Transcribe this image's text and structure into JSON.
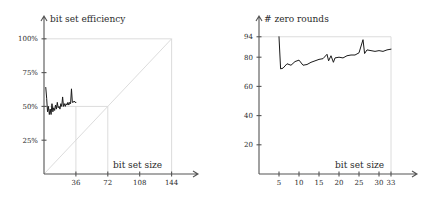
{
  "figure": {
    "background_color": "#ffffff",
    "line_color": "#1a1a1a",
    "guide_color": "#d8d8d8",
    "axis_color": "#555555",
    "panel_count": 2
  },
  "chart_data": [
    {
      "id": "bit-set-efficiency",
      "type": "line",
      "title": "",
      "ylabel": "bit set efficiency",
      "xlabel": "bit set size",
      "xlim": [
        0,
        158
      ],
      "ylim": [
        0,
        108
      ],
      "grid": false,
      "legend": "none",
      "xticks": [
        36,
        72,
        108,
        144
      ],
      "xtick_labels": [
        "36",
        "72",
        "108",
        "144"
      ],
      "yticks": [
        25,
        50,
        75,
        100
      ],
      "ytick_labels": [
        "25%",
        "50%",
        "75%",
        "100%"
      ],
      "guides": [
        {
          "kind": "horizontal",
          "y": 100,
          "x_from": 0,
          "x_to": 144
        },
        {
          "kind": "vertical",
          "x": 144,
          "y_from": 0,
          "y_to": 100
        },
        {
          "kind": "diagonal",
          "from": [
            0,
            0
          ],
          "to": [
            144,
            100
          ]
        },
        {
          "kind": "horizontal",
          "y": 50,
          "x_from": 0,
          "x_to": 72
        },
        {
          "kind": "vertical",
          "x": 72,
          "y_from": 0,
          "y_to": 50
        },
        {
          "kind": "vertical",
          "x": 36,
          "y_from": 0,
          "y_to": 50
        }
      ],
      "x": [
        2,
        3,
        4,
        5,
        6,
        7,
        8,
        9,
        10,
        11,
        12,
        13,
        14,
        15,
        16,
        17,
        18,
        19,
        20,
        21,
        22,
        23,
        24,
        25,
        26,
        27,
        28,
        29,
        30,
        31,
        32,
        33,
        34,
        35,
        36
      ],
      "values": [
        64,
        56,
        46,
        50,
        44,
        48,
        44,
        52,
        46,
        49,
        47,
        51,
        48,
        53,
        49,
        50,
        48,
        52,
        50,
        57,
        50,
        52,
        50,
        52,
        51,
        53,
        51,
        53,
        52,
        63,
        53,
        53,
        54,
        53,
        53
      ],
      "note": "oscillating series stabilizing near 50%, initial spike near 64% and a spike near 63% close to x=31"
    },
    {
      "id": "zero-rounds",
      "type": "line",
      "title": "",
      "ylabel": "# zero rounds",
      "xlabel": "bit set size",
      "xlim": [
        0,
        36
      ],
      "ylim": [
        0,
        100
      ],
      "grid": false,
      "legend": "none",
      "xticks": [
        5,
        10,
        15,
        20,
        25,
        30,
        33
      ],
      "xtick_labels": [
        "5",
        "10",
        "15",
        "20",
        "25",
        "30",
        "33"
      ],
      "yticks": [
        20,
        40,
        60,
        80,
        94
      ],
      "ytick_labels": [
        "20",
        "40",
        "60",
        "80",
        "94"
      ],
      "guides": [
        {
          "kind": "horizontal",
          "y": 94,
          "x_from": 0,
          "x_to": 33
        },
        {
          "kind": "vertical",
          "x": 33,
          "y_from": 0,
          "y_to": 94
        }
      ],
      "x": [
        5,
        5.4,
        6,
        7,
        8,
        9,
        10,
        11,
        12,
        13,
        14,
        15,
        16,
        17,
        17.4,
        18,
        18.6,
        19,
        20,
        21,
        22,
        23,
        24,
        25,
        26,
        26.4,
        27,
        28,
        29,
        30,
        31,
        32,
        33
      ],
      "values": [
        94,
        72,
        72.5,
        75.5,
        74.5,
        77,
        78,
        74.5,
        75,
        76.5,
        77.5,
        78.5,
        79,
        82,
        77.5,
        81,
        76.5,
        79.5,
        80,
        79.5,
        81,
        81.5,
        81.5,
        83,
        92,
        82.5,
        85,
        84.5,
        84,
        84.5,
        84,
        85,
        85.5
      ],
      "note": "starts at 94, drops sharply to ~72, then drifts upward to ~85 with spikes near x=17 and x=26"
    }
  ],
  "panels": {
    "left": {
      "name": "bit set efficiency chart",
      "y_axis_title": "bit set efficiency",
      "x_axis_title": "bit set size"
    },
    "right": {
      "name": "zero rounds chart",
      "y_axis_title": "# zero rounds",
      "x_axis_title": "bit set size"
    }
  }
}
